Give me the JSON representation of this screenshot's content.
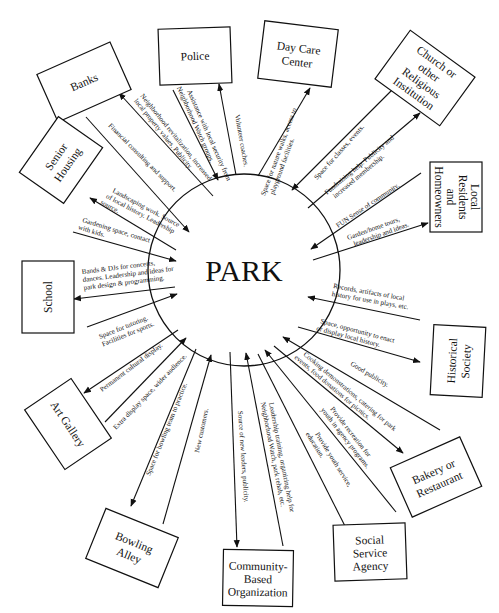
{
  "center": {
    "label": "PARK"
  },
  "nodes": [
    {
      "id": "banks",
      "lines": [
        "Banks"
      ]
    },
    {
      "id": "police",
      "lines": [
        "Police"
      ]
    },
    {
      "id": "daycare",
      "lines": [
        "Day Care",
        "Center"
      ]
    },
    {
      "id": "church",
      "lines": [
        "Church or",
        "other",
        "Religious",
        "Institution"
      ]
    },
    {
      "id": "residents",
      "lines": [
        "Local",
        "Residents",
        "and",
        "Homeowners"
      ]
    },
    {
      "id": "historical",
      "lines": [
        "Historical",
        "Society"
      ]
    },
    {
      "id": "bakery",
      "lines": [
        "Bakery or",
        "Restaurant"
      ]
    },
    {
      "id": "social",
      "lines": [
        "Social",
        "Service",
        "Agency"
      ]
    },
    {
      "id": "community",
      "lines": [
        "Community-",
        "Based",
        "Organization"
      ]
    },
    {
      "id": "bowling",
      "lines": [
        "Bowling",
        "Alley"
      ]
    },
    {
      "id": "artgallery",
      "lines": [
        "Art Gallery"
      ]
    },
    {
      "id": "school",
      "lines": [
        "School"
      ]
    },
    {
      "id": "senior",
      "lines": [
        "Senior",
        "Housing"
      ]
    }
  ],
  "edges": [
    {
      "from": "park",
      "to": "banks",
      "lines": [
        "Neighborhood revitalization, increased",
        "local property values. Publicity."
      ]
    },
    {
      "from": "banks",
      "to": "park",
      "lines": [
        "Financial consulting and support."
      ]
    },
    {
      "from": "park",
      "to": "police",
      "lines": [
        "Volunteer coaches."
      ]
    },
    {
      "from": "police",
      "to": "park",
      "lines": [
        "Assistance with local security from",
        "Neighborhood Watch groups."
      ]
    },
    {
      "from": "park",
      "to": "daycare",
      "lines": [
        "Space for nature walks, access to",
        "playground facilities."
      ]
    },
    {
      "from": "church",
      "to": "park",
      "lines": [
        "Space for classes, events."
      ]
    },
    {
      "from": "park",
      "to": "church",
      "lines": [
        "Fundraising help. Publicity and",
        "increased membership."
      ]
    },
    {
      "from": "residents",
      "to": "park",
      "lines": [
        "FUN Sense of community."
      ]
    },
    {
      "from": "park",
      "to": "residents",
      "lines": [
        "Garden/home tours,",
        "leadership and ideas."
      ]
    },
    {
      "from": "historical",
      "to": "park",
      "lines": [
        "Records, artifacts of local",
        "history for use in plays, etc."
      ]
    },
    {
      "from": "park",
      "to": "historical",
      "lines": [
        "Space, opportunity to enact",
        "or display local history."
      ]
    },
    {
      "from": "bakery",
      "to": "park",
      "lines": [
        "Good publicity."
      ]
    },
    {
      "from": "park",
      "to": "bakery",
      "lines": [
        "Cooking demonstrations, catering for park",
        "events, food donations for picnics."
      ]
    },
    {
      "from": "social",
      "to": "park",
      "lines": [
        "Provide recreation for",
        "youth in agency programs."
      ]
    },
    {
      "from": "park",
      "to": "social",
      "lines": [
        "Provide youth service,",
        "education."
      ]
    },
    {
      "from": "community",
      "to": "park",
      "lines": [
        "Leadership training, organizing help for",
        "Neighborhood Watch, park rehab, etc."
      ]
    },
    {
      "from": "park",
      "to": "community",
      "lines": [
        "Source of new leaders, publicity."
      ]
    },
    {
      "from": "bowling",
      "to": "park",
      "lines": [
        "New customers."
      ]
    },
    {
      "from": "park",
      "to": "bowling",
      "lines": [
        "Space for bowling team to practice."
      ]
    },
    {
      "from": "artgallery",
      "to": "park",
      "lines": [
        "Extra display space, wider audience."
      ]
    },
    {
      "from": "park",
      "to": "artgallery",
      "lines": [
        "Permanent cultural display."
      ]
    },
    {
      "from": "school",
      "to": "park",
      "lines": [
        "Space for tutoring.",
        "Facilities for sports."
      ]
    },
    {
      "from": "park",
      "to": "school",
      "lines": [
        "Bands & DJs for concerts,",
        "dances. Leadership and ideas for",
        "park design & programming."
      ]
    },
    {
      "from": "senior",
      "to": "park",
      "lines": [
        "Gardening space, contact",
        "with kids."
      ]
    },
    {
      "from": "park",
      "to": "senior",
      "lines": [
        "Landscaping work. Source",
        "of local history. Leadership",
        "source."
      ]
    }
  ]
}
